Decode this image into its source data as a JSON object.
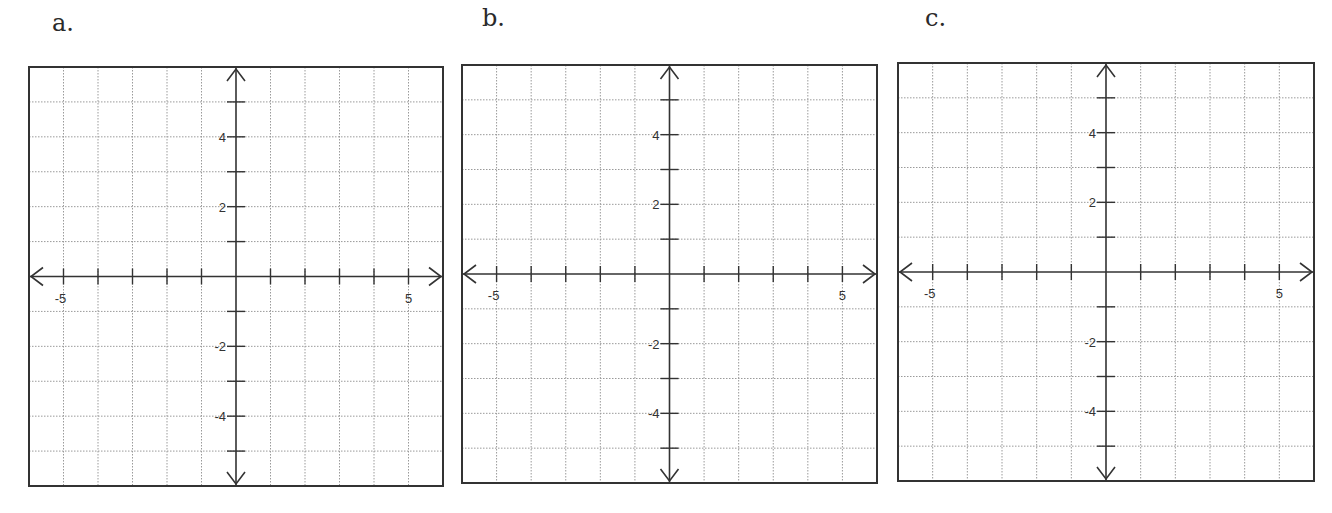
{
  "chart_data": [
    {
      "type": "line",
      "title": "a.",
      "xlabel": "",
      "ylabel": "",
      "xlim": [
        -6,
        6
      ],
      "ylim": [
        -6,
        6
      ],
      "grid": true,
      "grid_style": "dotted",
      "x_tick_labels": [
        "-5",
        "5"
      ],
      "y_tick_labels": [
        "4",
        "2",
        "-2",
        "-4"
      ],
      "series": [],
      "frame": {
        "left": 29,
        "top": 67,
        "right": 443,
        "bottom": 486
      }
    },
    {
      "type": "line",
      "title": "b.",
      "xlabel": "",
      "ylabel": "",
      "xlim": [
        -6,
        6
      ],
      "ylim": [
        -6,
        6
      ],
      "grid": true,
      "grid_style": "dotted",
      "x_tick_labels": [
        "-5",
        "5"
      ],
      "y_tick_labels": [
        "4",
        "2",
        "-2",
        "-4"
      ],
      "series": [],
      "frame": {
        "left": 462,
        "top": 65,
        "right": 877,
        "bottom": 483
      }
    },
    {
      "type": "line",
      "title": "c.",
      "xlabel": "",
      "ylabel": "",
      "xlim": [
        -6,
        6
      ],
      "ylim": [
        -6,
        6
      ],
      "grid": true,
      "grid_style": "dotted",
      "x_tick_labels": [
        "-5",
        "5"
      ],
      "y_tick_labels": [
        "4",
        "2",
        "-2",
        "-4"
      ],
      "series": [],
      "frame": {
        "left": 898,
        "top": 63,
        "right": 1314,
        "bottom": 481
      }
    }
  ],
  "panels": [
    {
      "label": "a."
    },
    {
      "label": "b."
    },
    {
      "label": "c."
    }
  ],
  "colors": {
    "frame": "#333333",
    "axis": "#333333",
    "grid": "#9a9a9a",
    "text": "#333333"
  }
}
